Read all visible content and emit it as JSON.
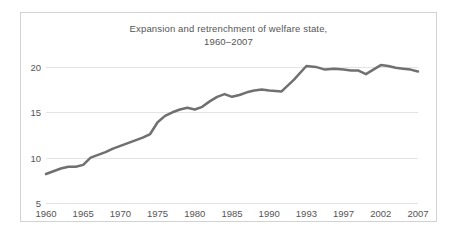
{
  "figure": {
    "border_color": "#d2d2d2",
    "background": "#ffffff"
  },
  "title": {
    "line1": "Expansion and retrenchment of welfare state,",
    "line2": "1960–2007"
  },
  "chart_data": {
    "type": "line",
    "title": "Expansion and retrenchment of welfare state, 1960–2007",
    "xlabel": "",
    "ylabel": "",
    "grid": true,
    "legend": false,
    "line_color": "#707070",
    "line_width": 2.5,
    "xlim": [
      1960,
      2007
    ],
    "ylim": [
      5,
      21.2
    ],
    "ytick_values": [
      5,
      10,
      15,
      20
    ],
    "ytick_labels": [
      "5",
      "10",
      "15",
      "20"
    ],
    "xtick_values": [
      1960,
      1965,
      1970,
      1975,
      1980,
      1985,
      1990,
      1993,
      1997,
      2002,
      2007
    ],
    "xtick_labels": [
      "1960",
      "1965",
      "1970",
      "1975",
      "1980",
      "1985",
      "1990",
      "1993",
      "1997",
      "2002",
      "2007"
    ],
    "x": [
      1960,
      1961,
      1962,
      1963,
      1964,
      1965,
      1966,
      1967,
      1968,
      1969,
      1970,
      1971,
      1972,
      1973,
      1974,
      1975,
      1976,
      1977,
      1978,
      1979,
      1980,
      1981,
      1982,
      1983,
      1984,
      1985,
      1986,
      1987,
      1988,
      1989,
      1990,
      1991,
      1992,
      1993,
      1994,
      1995,
      1996,
      1997,
      1998,
      1999,
      2000,
      2001,
      2002,
      2003,
      2004,
      2005,
      2006,
      2007
    ],
    "values": [
      8.2,
      8.5,
      8.8,
      9.0,
      9.0,
      9.2,
      10.0,
      10.3,
      10.6,
      11.0,
      11.3,
      11.6,
      11.9,
      12.2,
      12.6,
      13.9,
      14.6,
      15.0,
      15.3,
      15.5,
      15.3,
      15.6,
      16.2,
      16.7,
      17.0,
      16.7,
      16.9,
      17.2,
      17.4,
      17.5,
      17.4,
      17.3,
      18.6,
      20.1,
      20.0,
      19.7,
      19.8,
      19.7,
      19.6,
      19.6,
      19.2,
      19.7,
      20.2,
      20.1,
      19.9,
      19.8,
      19.7,
      19.5
    ]
  }
}
